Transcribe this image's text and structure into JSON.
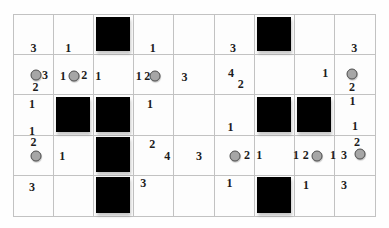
{
  "board": {
    "rows": 5,
    "cols": 9,
    "colors": {
      "background": "#fefefe",
      "grid_line": "#c2c2c2",
      "clue_text": "#1c1c1c",
      "circle_fill": "#a6a6a6",
      "circle_border": "#4f4f4f",
      "filled_square": "#000000"
    },
    "filled_squares": [
      {
        "row": 1,
        "col": 3
      },
      {
        "row": 1,
        "col": 7
      },
      {
        "row": 3,
        "col": 2
      },
      {
        "row": 3,
        "col": 3
      },
      {
        "row": 3,
        "col": 7
      },
      {
        "row": 3,
        "col": 8
      },
      {
        "row": 4,
        "col": 3
      },
      {
        "row": 5,
        "col": 3
      },
      {
        "row": 5,
        "col": 7
      }
    ],
    "circles": [
      {
        "row": 2,
        "col": 1,
        "x_pct": 55,
        "y_pct": 51
      },
      {
        "row": 2,
        "col": 2,
        "x_pct": 52,
        "y_pct": 53
      },
      {
        "row": 2,
        "col": 4,
        "x_pct": 54,
        "y_pct": 52
      },
      {
        "row": 2,
        "col": 9,
        "x_pct": 43,
        "y_pct": 47
      },
      {
        "row": 4,
        "col": 1,
        "x_pct": 56,
        "y_pct": 53
      },
      {
        "row": 4,
        "col": 6,
        "x_pct": 52,
        "y_pct": 51
      },
      {
        "row": 4,
        "col": 8,
        "x_pct": 58,
        "y_pct": 51
      },
      {
        "row": 4,
        "col": 9,
        "x_pct": 63,
        "y_pct": 48
      }
    ],
    "clues": [
      {
        "value": "3",
        "row": 1,
        "col": 1,
        "x_pct": 50,
        "y_pct": 83
      },
      {
        "value": "1",
        "row": 1,
        "col": 2,
        "x_pct": 36,
        "y_pct": 83
      },
      {
        "value": "1",
        "row": 1,
        "col": 4,
        "x_pct": 47,
        "y_pct": 83
      },
      {
        "value": "3",
        "row": 1,
        "col": 6,
        "x_pct": 47,
        "y_pct": 85
      },
      {
        "value": "3",
        "row": 1,
        "col": 9,
        "x_pct": 48,
        "y_pct": 83
      },
      {
        "value": "3",
        "row": 2,
        "col": 1,
        "x_pct": 79,
        "y_pct": 51
      },
      {
        "value": "2",
        "row": 2,
        "col": 1,
        "x_pct": 55,
        "y_pct": 82
      },
      {
        "value": "1",
        "row": 2,
        "col": 2,
        "x_pct": 23,
        "y_pct": 52
      },
      {
        "value": "2",
        "row": 2,
        "col": 2,
        "x_pct": 77,
        "y_pct": 51
      },
      {
        "value": "1",
        "row": 2,
        "col": 3,
        "x_pct": 10,
        "y_pct": 53
      },
      {
        "value": "1",
        "row": 2,
        "col": 4,
        "x_pct": 11,
        "y_pct": 52
      },
      {
        "value": "2",
        "row": 2,
        "col": 4,
        "x_pct": 33,
        "y_pct": 52
      },
      {
        "value": "3",
        "row": 2,
        "col": 5,
        "x_pct": 26,
        "y_pct": 55
      },
      {
        "value": "4",
        "row": 2,
        "col": 6,
        "x_pct": 42,
        "y_pct": 46
      },
      {
        "value": "2",
        "row": 2,
        "col": 6,
        "x_pct": 67,
        "y_pct": 73
      },
      {
        "value": "1",
        "row": 2,
        "col": 8,
        "x_pct": 78,
        "y_pct": 46
      },
      {
        "value": "2",
        "row": 2,
        "col": 9,
        "x_pct": 43,
        "y_pct": 82
      },
      {
        "value": "1",
        "row": 3,
        "col": 1,
        "x_pct": 46,
        "y_pct": 21
      },
      {
        "value": "1",
        "row": 3,
        "col": 1,
        "x_pct": 46,
        "y_pct": 91
      },
      {
        "value": "1",
        "row": 3,
        "col": 4,
        "x_pct": 40,
        "y_pct": 23
      },
      {
        "value": "1",
        "row": 3,
        "col": 6,
        "x_pct": 41,
        "y_pct": 80
      },
      {
        "value": "1",
        "row": 3,
        "col": 9,
        "x_pct": 44,
        "y_pct": 14
      },
      {
        "value": "1",
        "row": 3,
        "col": 9,
        "x_pct": 50,
        "y_pct": 78
      },
      {
        "value": "2",
        "row": 4,
        "col": 1,
        "x_pct": 50,
        "y_pct": 16
      },
      {
        "value": "1",
        "row": 4,
        "col": 2,
        "x_pct": 21,
        "y_pct": 53
      },
      {
        "value": "2",
        "row": 4,
        "col": 4,
        "x_pct": 46,
        "y_pct": 22
      },
      {
        "value": "4",
        "row": 4,
        "col": 4,
        "x_pct": 84,
        "y_pct": 51
      },
      {
        "value": "3",
        "row": 4,
        "col": 5,
        "x_pct": 63,
        "y_pct": 51
      },
      {
        "value": "2",
        "row": 4,
        "col": 6,
        "x_pct": 83,
        "y_pct": 49
      },
      {
        "value": "1",
        "row": 4,
        "col": 7,
        "x_pct": 12,
        "y_pct": 49
      },
      {
        "value": "1",
        "row": 4,
        "col": 8,
        "x_pct": 3,
        "y_pct": 49
      },
      {
        "value": "2",
        "row": 4,
        "col": 8,
        "x_pct": 28,
        "y_pct": 49
      },
      {
        "value": "1",
        "row": 4,
        "col": 8,
        "x_pct": 98,
        "y_pct": 49
      },
      {
        "value": "3",
        "row": 4,
        "col": 9,
        "x_pct": 23,
        "y_pct": 49
      },
      {
        "value": "2",
        "row": 4,
        "col": 9,
        "x_pct": 55,
        "y_pct": 17
      },
      {
        "value": "3",
        "row": 5,
        "col": 1,
        "x_pct": 46,
        "y_pct": 27
      },
      {
        "value": "3",
        "row": 5,
        "col": 4,
        "x_pct": 23,
        "y_pct": 17
      },
      {
        "value": "1",
        "row": 5,
        "col": 6,
        "x_pct": 38,
        "y_pct": 17
      },
      {
        "value": "1",
        "row": 5,
        "col": 8,
        "x_pct": 29,
        "y_pct": 22
      },
      {
        "value": "3",
        "row": 5,
        "col": 9,
        "x_pct": 23,
        "y_pct": 23
      }
    ]
  }
}
